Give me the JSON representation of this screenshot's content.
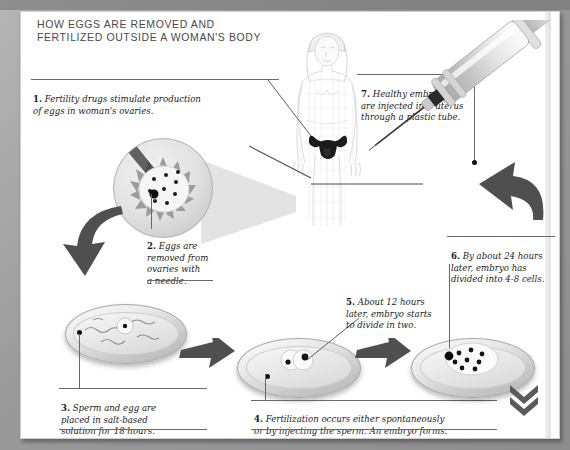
{
  "title": "HOW EGGS ARE REMOVED AND\nFERTILIZED OUTSIDE A WOMAN'S BODY",
  "captions": [
    {
      "number": "1.",
      "text": " Fertility drugs stimulate production\nof eggs in woman's ovaries."
    },
    {
      "number": "2.",
      "text": " Eggs are\nremoved from\novaries with\na needle."
    },
    {
      "number": "3.",
      "text": " Sperm and egg are\nplaced in salt-based\nsolution for 18 hours."
    },
    {
      "number": "4.",
      "text": " Fertilization occurs either spontaneously\nor by injecting the sperm. An embryo forms."
    },
    {
      "number": "5.",
      "text": " About 12 hours\nlater, embryo starts\nto divide in two."
    },
    {
      "number": "6.",
      "text": " By about 24 hours\nlater, embryo has\ndivided into 4-8 cells."
    },
    {
      "number": "7.",
      "text": " Healthy embryo cells\nare injected into uterus\nthrough a plastic tube."
    }
  ],
  "illustrations": {
    "body_figure": "woman-body-wireframe",
    "uterus": "uterus-organ",
    "ovary_magnifier": "ovary-closeup-circle",
    "needle": "aspiration-needle",
    "syringe": "syringe-with-needle",
    "dish_1": "petri-dish-sperm-and-egg",
    "dish_2": "petri-dish-two-cell-embryo",
    "dish_3": "petri-dish-multicell-embryo"
  },
  "dish_cells": {
    "dish_2_count": 2,
    "dish_3_count": 8,
    "ovary_follicle_count": 9
  },
  "footer_mark": "double-chevron-down",
  "colors": {
    "frame": "#9a9a9a",
    "panel": "#ffffff",
    "title_text": "#4a4a4a",
    "caption_text": "#1a1a1a",
    "arrow": "#4f4f4f",
    "leader": "#5d5d5d"
  }
}
